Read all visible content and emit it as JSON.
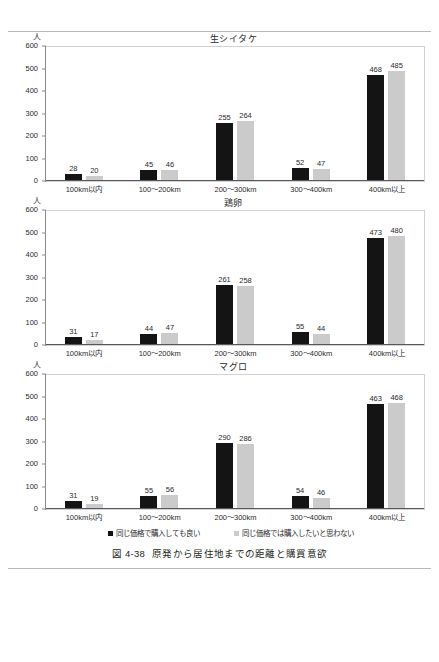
{
  "figure": {
    "caption_number": "図 4-38",
    "caption_text": "原発から居住地までの距離と購買意欲",
    "unit_label": "人",
    "legend": [
      {
        "label": "同じ価格で購入しても良い",
        "color": "#141414"
      },
      {
        "label": "同じ価格では購入したいと思わない",
        "color": "#cbcbcb"
      }
    ]
  },
  "chart_data": [
    {
      "type": "bar",
      "title": "生シイタケ",
      "xlabel": "",
      "ylabel": "人",
      "ylim": [
        0,
        600
      ],
      "yticks": [
        0,
        100,
        200,
        300,
        400,
        500,
        600
      ],
      "grid": false,
      "legend_position": "bottom",
      "categories": [
        "100km以内",
        "100〜200km",
        "200〜300km",
        "300〜400km",
        "400km以上"
      ],
      "series": [
        {
          "name": "同じ価格で購入しても良い",
          "color": "#141414",
          "values": [
            28,
            45,
            255,
            52,
            468
          ]
        },
        {
          "name": "同じ価格では購入したいと思わない",
          "color": "#cbcbcb",
          "values": [
            20,
            46,
            264,
            47,
            485
          ]
        }
      ]
    },
    {
      "type": "bar",
      "title": "鶏卵",
      "xlabel": "",
      "ylabel": "人",
      "ylim": [
        0,
        600
      ],
      "yticks": [
        0,
        100,
        200,
        300,
        400,
        500,
        600
      ],
      "grid": false,
      "legend_position": "bottom",
      "categories": [
        "100km以内",
        "100〜200km",
        "200〜300km",
        "300〜400km",
        "400km以上"
      ],
      "series": [
        {
          "name": "同じ価格で購入しても良い",
          "color": "#141414",
          "values": [
            31,
            44,
            261,
            55,
            473
          ]
        },
        {
          "name": "同じ価格では購入したいと思わない",
          "color": "#cbcbcb",
          "values": [
            17,
            47,
            258,
            44,
            480
          ]
        }
      ]
    },
    {
      "type": "bar",
      "title": "マグロ",
      "xlabel": "",
      "ylabel": "人",
      "ylim": [
        0,
        600
      ],
      "yticks": [
        0,
        100,
        200,
        300,
        400,
        500,
        600
      ],
      "grid": false,
      "legend_position": "bottom",
      "categories": [
        "100km以内",
        "100〜200km",
        "200〜300km",
        "300〜400km",
        "400km以上"
      ],
      "series": [
        {
          "name": "同じ価格で購入しても良い",
          "color": "#141414",
          "values": [
            31,
            55,
            290,
            54,
            463
          ]
        },
        {
          "name": "同じ価格では購入したいと思わない",
          "color": "#cbcbcb",
          "values": [
            19,
            56,
            286,
            46,
            468
          ]
        }
      ]
    }
  ]
}
